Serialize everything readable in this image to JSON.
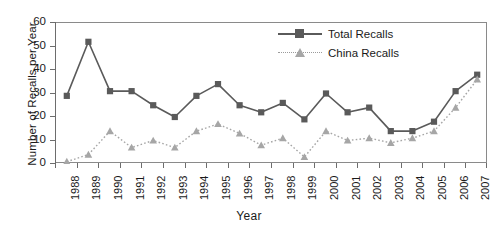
{
  "chart_data": {
    "type": "line",
    "title": "",
    "xlabel": "Year",
    "ylabel": "Number of Recalls per Year",
    "categories": [
      "1988",
      "1989",
      "1990",
      "1991",
      "1992",
      "1993",
      "1994",
      "1995",
      "1996",
      "1997",
      "1998",
      "1999",
      "2000",
      "2001",
      "2002",
      "2003",
      "2004",
      "2005",
      "2006",
      "2007"
    ],
    "ylim": [
      0,
      60
    ],
    "yticks": [
      0,
      10,
      20,
      30,
      40,
      50,
      60
    ],
    "grid": false,
    "legend_position": "top-right",
    "series": [
      {
        "name": "Total Recalls",
        "marker": "square",
        "line_style": "solid",
        "color": "#5a5a5a",
        "values": [
          29,
          52,
          31,
          31,
          25,
          20,
          29,
          34,
          25,
          22,
          26,
          19,
          30,
          22,
          24,
          14,
          14,
          18,
          31,
          38
        ]
      },
      {
        "name": "China Recalls",
        "marker": "triangle",
        "line_style": "dotted",
        "color": "#a6a6a6",
        "values": [
          1,
          4,
          14,
          7,
          10,
          7,
          14,
          17,
          13,
          8,
          11,
          3,
          14,
          10,
          11,
          9,
          11,
          14,
          24,
          36
        ]
      }
    ]
  },
  "legend": {
    "items": [
      {
        "label": "Total Recalls"
      },
      {
        "label": "China Recalls"
      }
    ]
  },
  "axes": {
    "y_title": "Number of Recalls per Year",
    "x_title": "Year"
  }
}
